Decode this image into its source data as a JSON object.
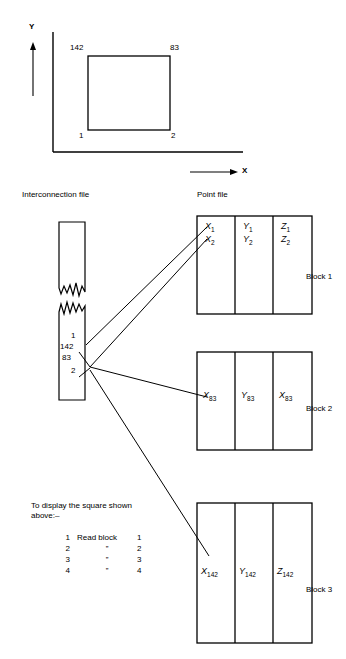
{
  "figure": {
    "axes": {
      "y_label": "Y",
      "x_label": "X"
    },
    "square_corner_labels": {
      "top_left": "142",
      "top_right": "83",
      "bottom_left": "1",
      "bottom_right": "2"
    }
  },
  "headers": {
    "interconnection_file": "Interconnection file",
    "point_file": "Point file"
  },
  "interconnection": {
    "entries": [
      "1",
      "142",
      "83",
      "2"
    ]
  },
  "blocks": [
    {
      "name": "Block 1",
      "rows": [
        {
          "x": "X",
          "x_sub": "1",
          "y": "Y",
          "y_sub": "1",
          "z": "Z",
          "z_sub": "1"
        },
        {
          "x": "X",
          "x_sub": "2",
          "y": "Y",
          "y_sub": "2",
          "z": "Z",
          "z_sub": "2"
        }
      ]
    },
    {
      "name": "Block 2",
      "rows": [
        {
          "x": "X",
          "x_sub": "83",
          "y": "Y",
          "y_sub": "83",
          "z": "X",
          "z_sub": "83"
        }
      ]
    },
    {
      "name": "Block 3",
      "rows": [
        {
          "x": "X",
          "x_sub": "142",
          "y": "Y",
          "y_sub": "142",
          "z": "Z",
          "z_sub": "142"
        }
      ]
    }
  ],
  "instructions": {
    "caption_line1": "To display the square shown",
    "caption_line2": "above:–",
    "rows": [
      {
        "index": "1",
        "action": "Read block",
        "operand": "1"
      },
      {
        "index": "2",
        "action": "”",
        "operand": "2"
      },
      {
        "index": "3",
        "action": "”",
        "operand": "3"
      },
      {
        "index": "4",
        "action": "”",
        "operand": "4"
      }
    ]
  },
  "colors": {
    "ink": "#000000",
    "paper": "#ffffff"
  }
}
